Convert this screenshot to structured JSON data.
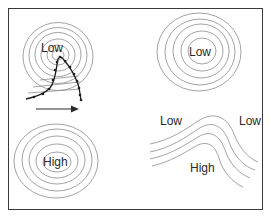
{
  "figure": {
    "panels": [
      {
        "id": "low-with-front",
        "label": "Low",
        "description": "Concentric low-pressure contours crossed by a frontal boundary with an arrow indicating movement to the right"
      },
      {
        "id": "isolated-low",
        "label": "Low"
      },
      {
        "id": "isolated-high",
        "label": "High"
      },
      {
        "id": "ridge",
        "labels": {
          "left_low": "Low",
          "right_low": "Low",
          "high": "High"
        }
      }
    ],
    "colors": {
      "border": "#3a3a3a",
      "contour": "#8c8c8c",
      "front": "#1e1e1e",
      "text": "#2a2a2a",
      "background": "#ffffff"
    }
  }
}
